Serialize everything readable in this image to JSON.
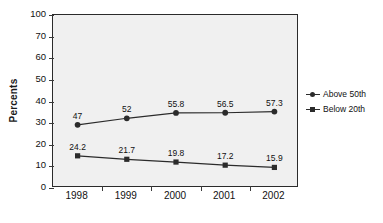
{
  "chart_data": {
    "type": "line",
    "title": "",
    "subtitle": "",
    "xlabel": "",
    "ylabel": "Percents",
    "categories": [
      "1998",
      "1999",
      "2000",
      "2001",
      "2002"
    ],
    "x": [
      1998,
      1999,
      2000,
      2001,
      2002
    ],
    "ylim": [
      0,
      100
    ],
    "ytick_labels": [
      "100",
      "70",
      "60",
      "50",
      "40",
      "30",
      "20",
      "10",
      "0"
    ],
    "ytick_values": [
      100,
      70,
      60,
      50,
      40,
      30,
      20,
      10,
      0
    ],
    "grid": false,
    "legend_position": "right",
    "series": [
      {
        "name": "Above 50th",
        "marker": "circle",
        "color": "#2b2b2b",
        "values": [
          47,
          52,
          55.8,
          56.5,
          57.3
        ],
        "value_labels": [
          "47",
          "52",
          "55.8",
          "56.5",
          "57.3"
        ],
        "plot_positions": [
          36.5,
          40.3,
          43.4,
          43.5,
          44.2
        ]
      },
      {
        "name": "Below 20th",
        "marker": "square",
        "color": "#2b2b2b",
        "values": [
          24.2,
          21.7,
          19.8,
          17.2,
          15.9
        ],
        "value_labels": [
          "24.2",
          "21.7",
          "19.8",
          "17.2",
          "15.9"
        ],
        "plot_positions": [
          18.6,
          16.6,
          15.0,
          13.2,
          11.9
        ]
      }
    ],
    "annotations": []
  },
  "legend": {
    "items": [
      {
        "label": "Above 50th",
        "marker": "circle"
      },
      {
        "label": "Below 20th",
        "marker": "square"
      }
    ]
  },
  "axes": {
    "y_title": "Percents"
  },
  "colors": {
    "plot_background": "#f0f0f0",
    "page_background": "#ffffff",
    "axis": "#2b2b2b",
    "series": "#2b2b2b",
    "text": "#111111"
  }
}
